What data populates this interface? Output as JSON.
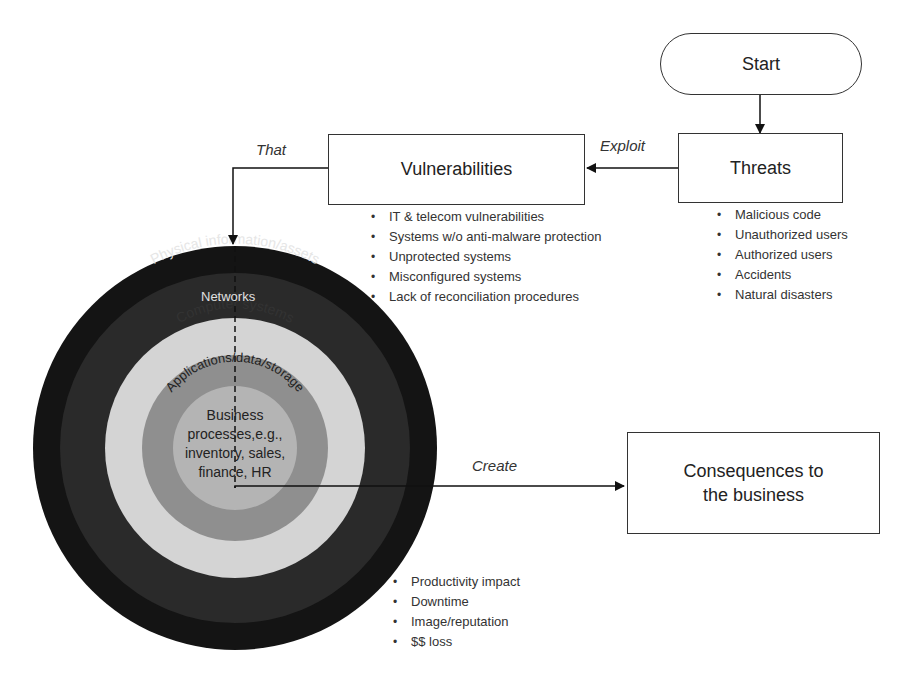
{
  "start": {
    "label": "Start"
  },
  "threats": {
    "label": "Threats",
    "items": [
      "Malicious code",
      "Unauthorized users",
      "Authorized users",
      "Accidents",
      "Natural disasters"
    ]
  },
  "vulnerabilities": {
    "label": "Vulnerabilities",
    "items": [
      "IT & telecom vulnerabilities",
      "Systems w/o anti-malware protection",
      "Unprotected systems",
      "Misconfigured systems",
      "Lack of reconciliation procedures"
    ]
  },
  "edges": {
    "exploit": "Exploit",
    "that": "That",
    "create": "Create"
  },
  "circle": {
    "rings": [
      {
        "label": "Physical information/assets",
        "color": "#141414"
      },
      {
        "label": "Networks",
        "color": "#2a2a2a"
      },
      {
        "label": "Computer systems",
        "color": "#d4d4d4"
      },
      {
        "label": "Applications/data/storage",
        "color": "#8f8f8f"
      }
    ],
    "center": {
      "lines": [
        "Business",
        "processes,e.g.,",
        "inventory, sales,",
        "finance, HR"
      ],
      "color": "#b4b4b4"
    }
  },
  "consequences": {
    "label_line1": "Consequences to",
    "label_line2": "the business",
    "items": [
      "Productivity impact",
      "Downtime",
      "Image/reputation",
      "$$ loss"
    ]
  }
}
